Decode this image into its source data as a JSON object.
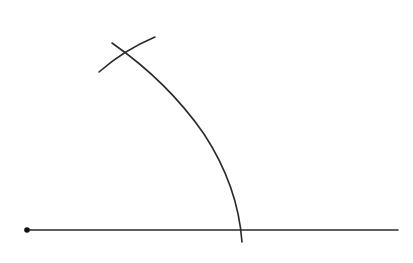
{
  "diagram": {
    "type": "geometric-construction",
    "canvas": {
      "width": 413,
      "height": 263,
      "background": "#ffffff"
    },
    "stroke_color": "#2a2a2a",
    "baseline": {
      "x1": 27,
      "y1": 230,
      "x2": 398,
      "y2": 230,
      "stroke_width": 1.6
    },
    "center_point": {
      "cx": 27,
      "cy": 230,
      "r": 2.8
    },
    "large_arc": {
      "path": "M 112 43 Q 168 82 204 134 Q 238 186 242 242",
      "stroke_width": 1.6
    },
    "small_arc": {
      "path": "M 99 72 Q 124 50 155 37",
      "stroke_width": 1.6
    }
  }
}
